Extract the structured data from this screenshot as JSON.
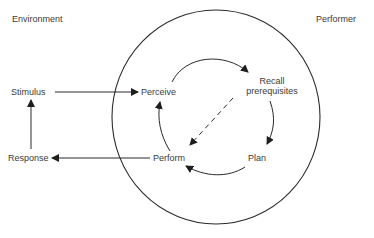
{
  "regions": {
    "environment": "Environment",
    "performer": "Performer"
  },
  "nodes": {
    "stimulus": "Stimulus",
    "response": "Response",
    "perceive": "Perceive",
    "recall_line1": "Recall",
    "recall_line2": "prerequisites",
    "plan": "Plan",
    "perform": "Perform"
  },
  "edges": [
    {
      "from": "Stimulus",
      "to": "Perceive",
      "style": "solid"
    },
    {
      "from": "Perceive",
      "to": "Recall prerequisites",
      "style": "solid"
    },
    {
      "from": "Recall prerequisites",
      "to": "Plan",
      "style": "solid"
    },
    {
      "from": "Plan",
      "to": "Perform",
      "style": "solid"
    },
    {
      "from": "Perform",
      "to": "Perceive",
      "style": "solid"
    },
    {
      "from": "Recall prerequisites",
      "to": "Perform",
      "style": "dashed"
    },
    {
      "from": "Perform",
      "to": "Response",
      "style": "solid"
    },
    {
      "from": "Response",
      "to": "Stimulus",
      "style": "solid"
    }
  ],
  "colors": {
    "line": "#2a2a2a",
    "text": "#3a3a3a"
  }
}
